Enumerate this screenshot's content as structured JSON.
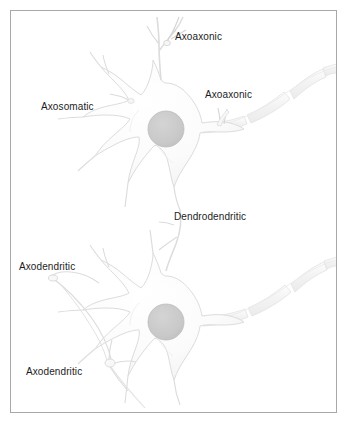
{
  "figure": {
    "background_color": "#ffffff",
    "border_color": "#a8a8a8",
    "label_text_color": "#1d1d1d",
    "soma_fill_color": "#fbfbfb",
    "soma_stroke_color": "#dcdcdc",
    "nucleus_fill_color": "#c9c9c9",
    "nucleus_stroke_color": "#bdbdbd",
    "myelin_fill_color": "#f4f4f4",
    "myelin_stroke_color": "#e2e2e2",
    "process_stroke_color": "#d8d8d8"
  },
  "labels": [
    {
      "id": "axoaxonic-top",
      "text": "Axoaxonic",
      "x": 175,
      "y": 31
    },
    {
      "id": "axoaxonic-axon",
      "text": "Axoaxonic",
      "x": 205,
      "y": 89
    },
    {
      "id": "axosomatic",
      "text": "Axosomatic",
      "x": 41,
      "y": 101
    },
    {
      "id": "dendrodendritic",
      "text": "Dendrodendritic",
      "x": 174,
      "y": 211
    },
    {
      "id": "axodendritic-upper",
      "text": "Axodendritic",
      "x": 19,
      "y": 261
    },
    {
      "id": "axodendritic-lower",
      "text": "Axodendritic",
      "x": 26,
      "y": 366
    }
  ],
  "neurons": [
    {
      "id": "neuron-upper",
      "soma_center": {
        "x": 155,
        "y": 118
      },
      "nucleus_center": {
        "x": 155,
        "y": 118
      },
      "nucleus_radius": 18,
      "axon_direction": "right-up"
    },
    {
      "id": "neuron-lower",
      "soma_center": {
        "x": 155,
        "y": 311
      },
      "nucleus_center": {
        "x": 155,
        "y": 311
      },
      "nucleus_radius": 18,
      "axon_direction": "right-up"
    }
  ],
  "synapse_types": [
    "Axoaxonic",
    "Axosomatic",
    "Dendrodendritic",
    "Axodendritic"
  ]
}
